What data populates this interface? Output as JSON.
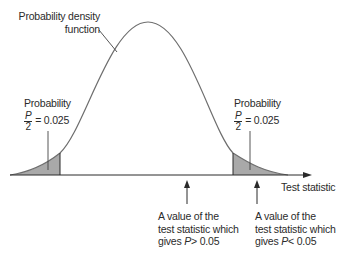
{
  "diagram": {
    "curve_label_line1": "Probability density",
    "curve_label_line2": "function",
    "left_tail": {
      "title": "Probability",
      "frac_num": "P",
      "frac_den": "2",
      "value": "= 0.025"
    },
    "right_tail": {
      "title": "Probability",
      "frac_num": "P",
      "frac_den": "2",
      "value": "= 0.025"
    },
    "x_axis_label": "Test statistic",
    "annotation_center": {
      "line1": "A value of the",
      "line2": "test statistic which",
      "line3_prefix": "gives ",
      "line3_var": "P",
      "line3_suffix": "> 0.05"
    },
    "annotation_right": {
      "line1": "A value of the",
      "line2": "test statistic which",
      "line3_prefix": "gives ",
      "line3_var": "P",
      "line3_suffix": "< 0.05"
    },
    "colors": {
      "curve": "#6e6e6e",
      "shade": "#a9a9a9",
      "axis": "#2a2a2a"
    }
  }
}
